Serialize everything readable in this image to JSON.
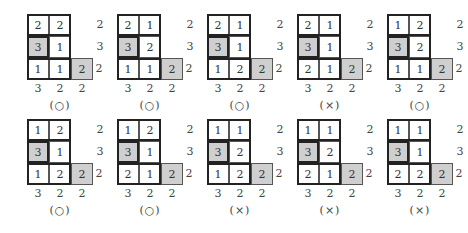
{
  "panels": [
    {
      "cells": [
        [
          "2",
          "2"
        ],
        [
          "3",
          "1"
        ],
        [
          "1",
          "1",
          "2"
        ]
      ],
      "row_labels": [
        "2",
        "3",
        "2"
      ],
      "col_labels": [
        "3",
        "2",
        "2"
      ],
      "verdict": "(○)"
    },
    {
      "cells": [
        [
          "2",
          "1"
        ],
        [
          "3",
          "2"
        ],
        [
          "1",
          "1",
          "2"
        ]
      ],
      "row_labels": [
        "2",
        "3",
        "2"
      ],
      "col_labels": [
        "3",
        "2",
        "2"
      ],
      "verdict": "(○)"
    },
    {
      "cells": [
        [
          "2",
          "1"
        ],
        [
          "3",
          "1"
        ],
        [
          "1",
          "2",
          "2"
        ]
      ],
      "row_labels": [
        "2",
        "3",
        "2"
      ],
      "col_labels": [
        "3",
        "2",
        "2"
      ],
      "verdict": "(○)"
    },
    {
      "cells": [
        [
          "2",
          "1"
        ],
        [
          "3",
          "1"
        ],
        [
          "2",
          "1",
          "2"
        ]
      ],
      "row_labels": [
        "2",
        "3",
        "2"
      ],
      "col_labels": [
        "3",
        "2",
        "2"
      ],
      "verdict": "(×)"
    },
    {
      "cells": [
        [
          "1",
          "2"
        ],
        [
          "3",
          "2"
        ],
        [
          "1",
          "1",
          "2"
        ]
      ],
      "row_labels": [
        "2",
        "3",
        "2"
      ],
      "col_labels": [
        "3",
        "2",
        "2"
      ],
      "verdict": "(○)"
    },
    {
      "cells": [
        [
          "1",
          "2"
        ],
        [
          "3",
          "1"
        ],
        [
          "1",
          "2",
          "2"
        ]
      ],
      "row_labels": [
        "2",
        "3",
        "2"
      ],
      "col_labels": [
        "3",
        "2",
        "2"
      ],
      "verdict": "(○)"
    },
    {
      "cells": [
        [
          "1",
          "2"
        ],
        [
          "3",
          "1"
        ],
        [
          "2",
          "1",
          "2"
        ]
      ],
      "row_labels": [
        "2",
        "3",
        "2"
      ],
      "col_labels": [
        "3",
        "2",
        "2"
      ],
      "verdict": "(○)"
    },
    {
      "cells": [
        [
          "1",
          "1"
        ],
        [
          "3",
          "2"
        ],
        [
          "1",
          "2",
          "2"
        ]
      ],
      "row_labels": [
        "2",
        "3",
        "2"
      ],
      "col_labels": [
        "3",
        "2",
        "2"
      ],
      "verdict": "(×)"
    },
    {
      "cells": [
        [
          "1",
          "1"
        ],
        [
          "3",
          "2"
        ],
        [
          "2",
          "1",
          "2"
        ]
      ],
      "row_labels": [
        "2",
        "3",
        "2"
      ],
      "col_labels": [
        "3",
        "2",
        "2"
      ],
      "verdict": "(×)"
    },
    {
      "cells": [
        [
          "1",
          "1"
        ],
        [
          "3",
          "1"
        ],
        [
          "2",
          "2",
          "2"
        ]
      ],
      "row_labels": [
        "2",
        "3",
        "2"
      ],
      "col_labels": [
        "3",
        "2",
        "2"
      ],
      "verdict": "(×)"
    }
  ],
  "colors": {
    "shaded": "#cfcfcf",
    "border": "#222222"
  }
}
